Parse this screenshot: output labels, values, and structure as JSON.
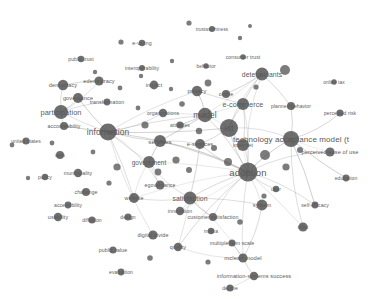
{
  "meta": {
    "visual_type": "network-map",
    "background_color": "#ffffff",
    "node_color": "#4a4a4a",
    "edge_color": "#9a9a9a",
    "label_color": "#5a5a5a",
    "width": 381,
    "height": 299
  },
  "chart_data": {
    "type": "network",
    "title": "",
    "xlabel": "",
    "ylabel": "",
    "node_count": 78,
    "nodes": [
      {
        "label": "trustworthiness",
        "x": 212,
        "y": 29,
        "size": 3,
        "font": 4.6
      },
      {
        "label": "e-voting",
        "x": 142,
        "y": 43,
        "size": 3.2,
        "font": 5.2
      },
      {
        "label": "consumer trust",
        "x": 243,
        "y": 57,
        "size": 2.8,
        "font": 5.0
      },
      {
        "label": "public trust",
        "x": 81,
        "y": 59,
        "size": 3.2,
        "font": 5.0
      },
      {
        "label": "interoperability",
        "x": 142,
        "y": 68,
        "size": 3.0,
        "font": 5.0
      },
      {
        "label": "behavior",
        "x": 206,
        "y": 66,
        "size": 2.8,
        "font": 4.8
      },
      {
        "label": "determinants",
        "x": 262,
        "y": 74,
        "size": 6.5,
        "font": 6.8
      },
      {
        "label": "online tax",
        "x": 334,
        "y": 82,
        "size": 2.8,
        "font": 4.8
      },
      {
        "label": "democracy",
        "x": 63,
        "y": 85,
        "size": 5.2,
        "font": 5.6
      },
      {
        "label": "edemocracy",
        "x": 99,
        "y": 81,
        "size": 4.6,
        "font": 5.6
      },
      {
        "label": "impact",
        "x": 154,
        "y": 85,
        "size": 4.4,
        "font": 5.4
      },
      {
        "label": "privacy",
        "x": 197,
        "y": 91,
        "size": 5.2,
        "font": 5.8
      },
      {
        "label": "governance",
        "x": 78,
        "y": 98,
        "size": 5.0,
        "font": 5.6
      },
      {
        "label": "online",
        "x": 226,
        "y": 94,
        "size": 4.0,
        "font": 5.2
      },
      {
        "label": "e-commerce",
        "x": 243,
        "y": 104,
        "size": 6.0,
        "font": 7.2
      },
      {
        "label": "planned behavior",
        "x": 291,
        "y": 106,
        "size": 4.0,
        "font": 5.0
      },
      {
        "label": "participation",
        "x": 61,
        "y": 112,
        "size": 7.0,
        "font": 7.4
      },
      {
        "label": "transformation",
        "x": 107,
        "y": 102,
        "size": 3.4,
        "font": 5.2
      },
      {
        "label": "perceived risk",
        "x": 340,
        "y": 113,
        "size": 3.6,
        "font": 5.0
      },
      {
        "label": "organizations",
        "x": 163,
        "y": 113,
        "size": 4.2,
        "font": 5.2
      },
      {
        "label": "model",
        "x": 205,
        "y": 115,
        "size": 7.2,
        "font": 8.4
      },
      {
        "label": "ict",
        "x": 229,
        "y": 128,
        "size": 9.0,
        "font": 9.0
      },
      {
        "label": "accountability",
        "x": 64,
        "y": 126,
        "size": 4.0,
        "font": 5.2
      },
      {
        "label": "information",
        "x": 108,
        "y": 132,
        "size": 8.5,
        "font": 8.4
      },
      {
        "label": "attitudes",
        "x": 180,
        "y": 125,
        "size": 3.6,
        "font": 5.0
      },
      {
        "label": "technology acceptance model (t",
        "x": 291,
        "y": 139,
        "size": 8.0,
        "font": 8.0
      },
      {
        "label": "united states",
        "x": 26,
        "y": 141,
        "size": 3.6,
        "font": 5.0
      },
      {
        "label": "services",
        "x": 160,
        "y": 141,
        "size": 6.0,
        "font": 6.2
      },
      {
        "label": "e-services",
        "x": 200,
        "y": 144,
        "size": 5.0,
        "font": 5.6
      },
      {
        "label": "internet",
        "x": 243,
        "y": 145,
        "size": 6.0,
        "font": 5.8
      },
      {
        "label": "perceived ease of use",
        "x": 330,
        "y": 152,
        "size": 4.6,
        "font": 5.6
      },
      {
        "label": "web",
        "x": 60,
        "y": 155,
        "size": 4.0,
        "font": 5.2
      },
      {
        "label": "government",
        "x": 149,
        "y": 162,
        "size": 6.0,
        "font": 6.4
      },
      {
        "label": "egovernance",
        "x": 160,
        "y": 185,
        "size": 4.6,
        "font": 5.2
      },
      {
        "label": "policy",
        "x": 45,
        "y": 177,
        "size": 3.2,
        "font": 5.2
      },
      {
        "label": "municipality",
        "x": 78,
        "y": 173,
        "size": 4.2,
        "font": 5.2
      },
      {
        "label": "adoption",
        "x": 248,
        "y": 172,
        "size": 9.5,
        "font": 9.5
      },
      {
        "label": "challenge",
        "x": 86,
        "y": 192,
        "size": 4.0,
        "font": 5.2
      },
      {
        "label": "website",
        "x": 134,
        "y": 198,
        "size": 5.0,
        "font": 5.4
      },
      {
        "label": "user",
        "x": 276,
        "y": 189,
        "size": 3.2,
        "font": 5.0
      },
      {
        "label": "accessibility",
        "x": 68,
        "y": 205,
        "size": 3.4,
        "font": 5.0
      },
      {
        "label": "satisfaction",
        "x": 190,
        "y": 198,
        "size": 6.5,
        "font": 6.8
      },
      {
        "label": "innovation",
        "x": 180,
        "y": 211,
        "size": 4.2,
        "font": 5.2
      },
      {
        "label": "self-efficacy",
        "x": 315,
        "y": 205,
        "size": 3.4,
        "font": 5.0
      },
      {
        "label": "usability",
        "x": 58,
        "y": 217,
        "size": 4.2,
        "font": 5.4
      },
      {
        "label": "system",
        "x": 262,
        "y": 205,
        "size": 5.4,
        "font": 5.6
      },
      {
        "label": "customer satisfaction",
        "x": 213,
        "y": 217,
        "size": 4.0,
        "font": 5.2
      },
      {
        "label": "diffusion",
        "x": 92,
        "y": 220,
        "size": 3.6,
        "font": 5.0
      },
      {
        "label": "design",
        "x": 128,
        "y": 217,
        "size": 3.6,
        "font": 5.0
      },
      {
        "label": "trust",
        "x": 303,
        "y": 227,
        "size": 4.6,
        "font": 5.2
      },
      {
        "label": "media",
        "x": 211,
        "y": 231,
        "size": 3.2,
        "font": 5.0
      },
      {
        "label": "digital divide",
        "x": 153,
        "y": 235,
        "size": 4.6,
        "font": 5.4
      },
      {
        "label": "multiple item scale",
        "x": 232,
        "y": 243,
        "size": 3.6,
        "font": 5.2
      },
      {
        "label": "public value",
        "x": 113,
        "y": 250,
        "size": 3.6,
        "font": 5.2
      },
      {
        "label": "quality",
        "x": 178,
        "y": 247,
        "size": 4.2,
        "font": 5.4
      },
      {
        "label": "mclean model",
        "x": 243,
        "y": 258,
        "size": 4.6,
        "font": 5.8
      },
      {
        "label": "information-systems success",
        "x": 254,
        "y": 276,
        "size": 4.2,
        "font": 5.6
      },
      {
        "label": "evaluation",
        "x": 121,
        "y": 272,
        "size": 3.4,
        "font": 5.0
      },
      {
        "label": "delone",
        "x": 230,
        "y": 288,
        "size": 3.6,
        "font": 5.0
      },
      {
        "label": "education",
        "x": 346,
        "y": 178,
        "size": 3.4,
        "font": 5.0
      }
    ],
    "unlabeled_nodes": [
      {
        "x": 189,
        "y": 23,
        "size": 2.6
      },
      {
        "x": 240,
        "y": 38,
        "size": 2.2
      },
      {
        "x": 121,
        "y": 42,
        "size": 2.6
      },
      {
        "x": 172,
        "y": 61,
        "size": 2.2
      },
      {
        "x": 250,
        "y": 26,
        "size": 2.0
      },
      {
        "x": 95,
        "y": 72,
        "size": 2.2
      },
      {
        "x": 120,
        "y": 88,
        "size": 2.4
      },
      {
        "x": 141,
        "y": 76,
        "size": 2.2
      },
      {
        "x": 171,
        "y": 89,
        "size": 2.2
      },
      {
        "x": 285,
        "y": 70,
        "size": 5.0
      },
      {
        "x": 208,
        "y": 83,
        "size": 3.4
      },
      {
        "x": 256,
        "y": 87,
        "size": 2.6
      },
      {
        "x": 182,
        "y": 104,
        "size": 2.8
      },
      {
        "x": 138,
        "y": 108,
        "size": 2.4
      },
      {
        "x": 199,
        "y": 131,
        "size": 3.2
      },
      {
        "x": 145,
        "y": 125,
        "size": 3.6
      },
      {
        "x": 214,
        "y": 148,
        "size": 3.0
      },
      {
        "x": 265,
        "y": 155,
        "size": 5.0
      },
      {
        "x": 228,
        "y": 162,
        "size": 4.0
      },
      {
        "x": 176,
        "y": 160,
        "size": 3.6
      },
      {
        "x": 117,
        "y": 167,
        "size": 3.6
      },
      {
        "x": 28,
        "y": 178,
        "size": 2.2
      },
      {
        "x": 158,
        "y": 172,
        "size": 3.4
      },
      {
        "x": 109,
        "y": 183,
        "size": 2.6
      },
      {
        "x": 189,
        "y": 170,
        "size": 3.0
      },
      {
        "x": 286,
        "y": 167,
        "size": 3.6
      },
      {
        "x": 300,
        "y": 150,
        "size": 3.0
      },
      {
        "x": 240,
        "y": 222,
        "size": 2.8
      },
      {
        "x": 150,
        "y": 258,
        "size": 2.8
      },
      {
        "x": 208,
        "y": 262,
        "size": 2.6
      },
      {
        "x": 264,
        "y": 196,
        "size": 2.6
      },
      {
        "x": 93,
        "y": 152,
        "size": 2.4
      },
      {
        "x": 12,
        "y": 145,
        "size": 2.4
      },
      {
        "x": 52,
        "y": 143,
        "size": 2.4
      }
    ],
    "edges": [
      [
        "participation",
        "information"
      ],
      [
        "participation",
        "governance"
      ],
      [
        "participation",
        "democracy"
      ],
      [
        "participation",
        "accountability"
      ],
      [
        "participation",
        "edemocracy"
      ],
      [
        "participation",
        "transformation"
      ],
      [
        "governance",
        "information"
      ],
      [
        "democracy",
        "edemocracy"
      ],
      [
        "accountability",
        "information"
      ],
      [
        "information",
        "government"
      ],
      [
        "information",
        "website"
      ],
      [
        "information",
        "services"
      ],
      [
        "information",
        "ict"
      ],
      [
        "information",
        "model"
      ],
      [
        "information",
        "adoption"
      ],
      [
        "information",
        "privacy"
      ],
      [
        "information",
        "organizations"
      ],
      [
        "information",
        "egovernance"
      ],
      [
        "government",
        "egovernance"
      ],
      [
        "government",
        "website"
      ],
      [
        "government",
        "adoption"
      ],
      [
        "government",
        "satisfaction"
      ],
      [
        "website",
        "satisfaction"
      ],
      [
        "website",
        "adoption"
      ],
      [
        "model",
        "ict"
      ],
      [
        "model",
        "e-commerce"
      ],
      [
        "model",
        "determinants"
      ],
      [
        "model",
        "attitudes"
      ],
      [
        "model",
        "adoption"
      ],
      [
        "model",
        "services"
      ],
      [
        "ict",
        "adoption"
      ],
      [
        "ict",
        "e-commerce"
      ],
      [
        "ict",
        "determinants"
      ],
      [
        "ict",
        "internet"
      ],
      [
        "ict",
        "e-services"
      ],
      [
        "ict",
        "technology acceptance model (t"
      ],
      [
        "determinants",
        "e-commerce"
      ],
      [
        "determinants",
        "online"
      ],
      [
        "determinants",
        "planned behavior"
      ],
      [
        "determinants",
        "adoption"
      ],
      [
        "e-commerce",
        "adoption"
      ],
      [
        "e-commerce",
        "internet"
      ],
      [
        "adoption",
        "technology acceptance model (t"
      ],
      [
        "adoption",
        "satisfaction"
      ],
      [
        "adoption",
        "system"
      ],
      [
        "adoption",
        "trust"
      ],
      [
        "adoption",
        "user"
      ],
      [
        "adoption",
        "internet"
      ],
      [
        "adoption",
        "e-services"
      ],
      [
        "adoption",
        "perceived ease of use"
      ],
      [
        "adoption",
        "self-efficacy"
      ],
      [
        "adoption",
        "innovation"
      ],
      [
        "adoption",
        "customer satisfaction"
      ],
      [
        "adoption",
        "quality"
      ],
      [
        "adoption",
        "mclean model"
      ],
      [
        "technology acceptance model (t",
        "perceived ease of use"
      ],
      [
        "technology acceptance model (t",
        "perceived risk"
      ],
      [
        "technology acceptance model (t",
        "planned behavior"
      ],
      [
        "technology acceptance model (t",
        "trust"
      ],
      [
        "technology acceptance model (t",
        "education"
      ],
      [
        "technology acceptance model (t",
        "self-efficacy"
      ],
      [
        "satisfaction",
        "customer satisfaction"
      ],
      [
        "satisfaction",
        "innovation"
      ],
      [
        "satisfaction",
        "quality"
      ],
      [
        "satisfaction",
        "mclean model"
      ],
      [
        "satisfaction",
        "system"
      ],
      [
        "system",
        "mclean model"
      ],
      [
        "mclean model",
        "information-systems success"
      ],
      [
        "mclean model",
        "multiple item scale"
      ],
      [
        "information-systems success",
        "delone"
      ],
      [
        "quality",
        "mclean model"
      ],
      [
        "services",
        "e-services"
      ],
      [
        "services",
        "adoption"
      ],
      [
        "services",
        "government"
      ],
      [
        "privacy",
        "e-commerce"
      ],
      [
        "privacy",
        "model"
      ],
      [
        "organizations",
        "model"
      ],
      [
        "digital divide",
        "information"
      ],
      [
        "e-services",
        "satisfaction"
      ],
      [
        "internet",
        "adoption"
      ]
    ]
  }
}
